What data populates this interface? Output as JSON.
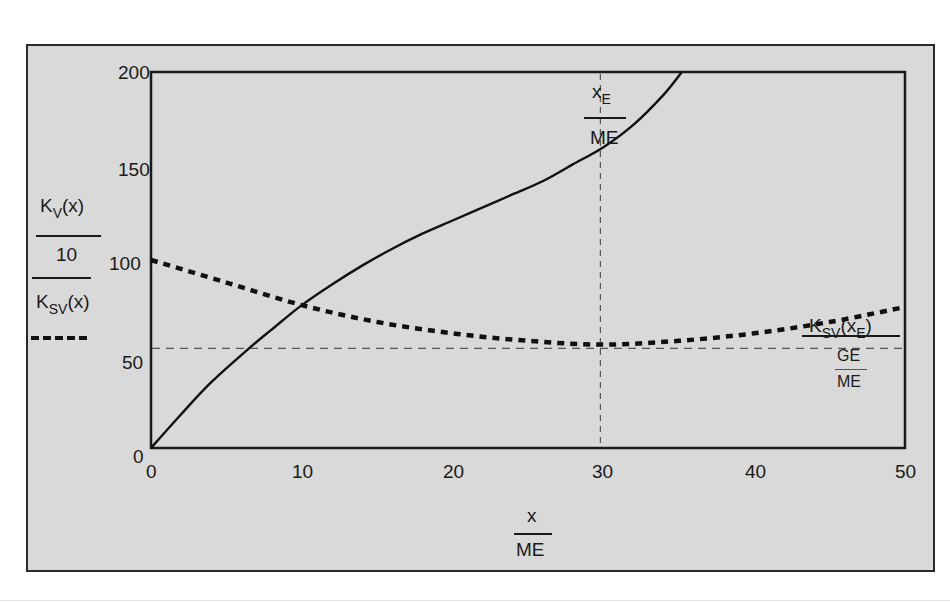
{
  "chart_data": {
    "type": "line",
    "title": "",
    "xlabel": {
      "numerator": "x",
      "denominator": "ME"
    },
    "ylabel": {
      "series1": {
        "expr": "K",
        "sub": "V",
        "arg": "(x)",
        "divisor": "10"
      },
      "series2": {
        "expr": "K",
        "sub": "SV",
        "arg": "(x)"
      }
    },
    "xlim": [
      0,
      50
    ],
    "ylim": [
      0,
      200
    ],
    "x_ticks": [
      "0",
      "10",
      "20",
      "30",
      "40",
      "50"
    ],
    "y_ticks": [
      "0",
      "50",
      "100",
      "150",
      "200"
    ],
    "grid": false,
    "series": [
      {
        "name": "K_V(x)/10",
        "style": "solid",
        "x": [
          0,
          2,
          4,
          6.5,
          8,
          10,
          12,
          14,
          16,
          18,
          20,
          22,
          24,
          26,
          28,
          30,
          32,
          34,
          35.2
        ],
        "values": [
          0,
          18,
          35,
          53,
          63,
          76,
          87,
          97,
          106,
          114,
          121,
          128,
          135,
          142,
          151,
          160,
          172,
          188,
          200
        ]
      },
      {
        "name": "K_SV(x)",
        "style": "dotted",
        "x": [
          0,
          5,
          10,
          15,
          20,
          25,
          30,
          35,
          40,
          45,
          50
        ],
        "values": [
          100,
          88,
          76,
          67,
          61,
          57,
          55,
          57,
          61,
          67,
          75
        ]
      }
    ],
    "annotations": [
      {
        "type": "vline",
        "x": 29.8,
        "style": "dashed",
        "label": {
          "numerator": "x",
          "sub": "E",
          "denominator": "ME"
        }
      },
      {
        "type": "hline",
        "y": 53,
        "style": "dashed",
        "label": {
          "expr": "K",
          "sub": "SV",
          "arg": "x",
          "argsub": "E",
          "numerator2": "GE",
          "denominator2": "ME"
        }
      }
    ]
  },
  "labels": {
    "left_num_k": "K",
    "left_num_sub": "V",
    "left_num_arg": "(x)",
    "left_den": "10",
    "left2_k": "K",
    "left2_sub": "SV",
    "left2_arg": "(x)",
    "bottom_num": "x",
    "bottom_den": "ME",
    "xe_x": "x",
    "xe_sub": "E",
    "xe_den": "ME",
    "ksv_k": "K",
    "ksv_sub": "SV",
    "ksv_open": "(",
    "ksv_x": "x",
    "ksv_xsub": "E",
    "ksv_close": ")",
    "ge": "GE",
    "me": "ME"
  },
  "colors": {
    "panel": "#d9d9d9",
    "line": "#111111",
    "guide": "#555555"
  }
}
